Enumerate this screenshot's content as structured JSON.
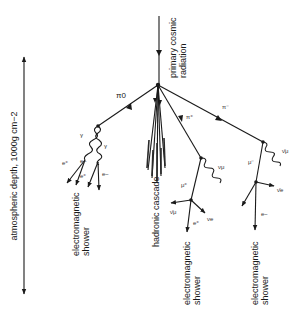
{
  "diagram": {
    "axis": {
      "label": "atmospheric depth, 1000g  cm−2"
    },
    "primary": {
      "label_line1": "primary cosmic",
      "label_line2": "radiation"
    },
    "particles": {
      "pi0": "π0",
      "pi_plus": "π⁺",
      "pi_minus": "π⁻",
      "gamma1": "γ",
      "gamma2": "γ",
      "e_plus_1": "e⁺",
      "e_minus_1": "e−",
      "e_plus_2": "e⁺",
      "e_minus_2": "e−",
      "mu_plus": "μ⁺",
      "nu_mu": "νμ",
      "nu_mu_bar_1": "ν̄μ",
      "nu_e": "νe",
      "e_plus_3": "e⁺",
      "mu_minus": "μ⁻",
      "nu_mu_bar_2": "ν̄μ",
      "nu_e_bar": "ν̄e",
      "e_minus_3": "e−"
    },
    "regions": {
      "hadronic": "hadronic cascade",
      "em_left_line1": "electromagnetic",
      "em_left_line2": "shower",
      "em_mid_line1": "electromagnetic",
      "em_mid_line2": "shower",
      "em_right_line1": "electromagnetic",
      "em_right_line2": "shower"
    }
  }
}
